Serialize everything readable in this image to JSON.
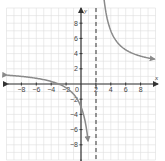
{
  "chart_data": {
    "type": "line",
    "title": "",
    "xlabel": "x",
    "ylabel": "y",
    "xlim": [
      -10,
      10
    ],
    "ylim": [
      -10,
      10
    ],
    "grid": true,
    "grid_step": 1,
    "x_ticks": [
      -8,
      -6,
      -4,
      -2,
      2,
      4,
      6,
      8
    ],
    "y_ticks": [
      -8,
      -6,
      -4,
      -2,
      2,
      4,
      6,
      8
    ],
    "origin_label": "0",
    "function": "y = 2 + 10/(x - 2)",
    "vertical_asymptote": {
      "x": 2,
      "style": "dashed"
    },
    "horizontal_asymptote": {
      "y": 2,
      "drawn": false
    },
    "series": [
      {
        "name": "left branch",
        "x": [
          -10,
          -8,
          -6,
          -4,
          -3,
          -2,
          -1,
          0,
          0.5,
          1,
          1.2
        ],
        "y": [
          1.17,
          1.0,
          0.75,
          0.33,
          0,
          -0.5,
          -1.33,
          -3,
          -4.67,
          -8,
          -10.5
        ]
      },
      {
        "name": "right branch",
        "x": [
          3.2,
          4,
          5,
          6,
          7,
          8,
          9,
          10
        ],
        "y": [
          10.33,
          7,
          5.33,
          4.5,
          4,
          3.67,
          3.43,
          3.25
        ]
      }
    ],
    "colors": {
      "curve": "#8a8a8a",
      "axes": "#333333",
      "grid": "#dddddd",
      "asymptote": "#333333"
    }
  },
  "labels": {
    "x_axis": "x",
    "y_axis": "y",
    "origin": "0",
    "x_ticks": [
      "−8",
      "−6",
      "−4",
      "−2",
      "2",
      "4",
      "6",
      "8"
    ],
    "y_ticks": [
      "8",
      "6",
      "4",
      "2",
      "−2",
      "−4",
      "−6",
      "−8"
    ]
  }
}
